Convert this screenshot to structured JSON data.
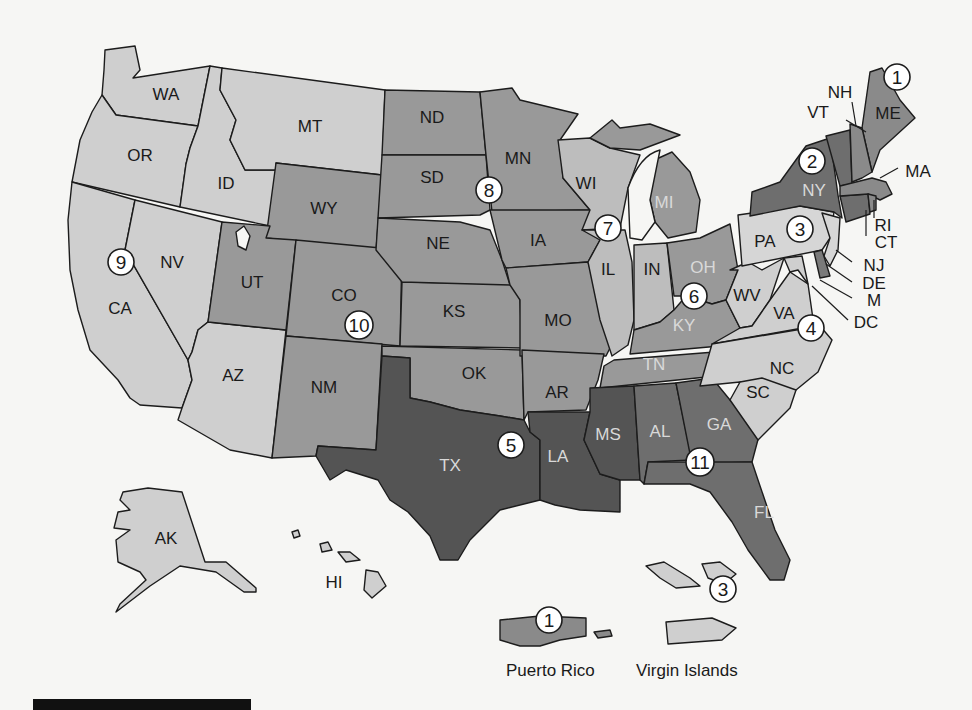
{
  "colors": {
    "background": "#f6f6f4",
    "shade_lightest": "#cfcfcf",
    "shade_light": "#bdbdbd",
    "shade_medium": "#9a9a9a",
    "shade_dark": "#7a7a7a",
    "shade_darkest": "#545454",
    "border": "#1c1c1c"
  },
  "states": {
    "WA": "WA",
    "OR": "OR",
    "CA": "CA",
    "NV": "NV",
    "ID": "ID",
    "MT": "MT",
    "AZ": "AZ",
    "AK": "AK",
    "HI": "HI",
    "WY": "WY",
    "UT": "UT",
    "CO": "CO",
    "NM": "NM",
    "KS": "KS",
    "OK": "OK",
    "ND": "ND",
    "SD": "SD",
    "NE": "NE",
    "MN": "MN",
    "IA": "IA",
    "MO": "MO",
    "AR": "AR",
    "WI": "WI",
    "IL": "IL",
    "IN": "IN",
    "MI": "MI",
    "OH": "OH",
    "KY": "KY",
    "TN": "TN",
    "TX": "TX",
    "LA": "LA",
    "MS": "MS",
    "AL": "AL",
    "GA": "GA",
    "FL": "FL",
    "WV": "WV",
    "VA": "VA",
    "NC": "NC",
    "SC": "SC",
    "MD": "M",
    "PA": "PA",
    "NJ": "NJ",
    "DE": "DE",
    "NY": "NY",
    "VT": "VT",
    "CT": "CT",
    "ME": "ME",
    "NH": "NH",
    "MA": "MA",
    "RI": "RI",
    "DC": "DC"
  },
  "circuits": [
    {
      "number": "1",
      "states": [
        "ME",
        "NH",
        "MA",
        "RI"
      ],
      "territories": [
        "Puerto Rico"
      ]
    },
    {
      "number": "2",
      "states": [
        "NY",
        "VT",
        "CT"
      ]
    },
    {
      "number": "3",
      "states": [
        "PA",
        "NJ",
        "DE"
      ],
      "territories": [
        "Virgin Islands"
      ]
    },
    {
      "number": "4",
      "states": [
        "MD",
        "VA",
        "WV",
        "NC",
        "SC"
      ]
    },
    {
      "number": "5",
      "states": [
        "TX",
        "LA",
        "MS"
      ]
    },
    {
      "number": "6",
      "states": [
        "MI",
        "OH",
        "KY",
        "TN"
      ]
    },
    {
      "number": "7",
      "states": [
        "WI",
        "IL",
        "IN"
      ]
    },
    {
      "number": "8",
      "states": [
        "ND",
        "SD",
        "NE",
        "MN",
        "IA",
        "MO",
        "AR"
      ]
    },
    {
      "number": "9",
      "states": [
        "WA",
        "OR",
        "CA",
        "NV",
        "ID",
        "MT",
        "AZ",
        "AK",
        "HI"
      ]
    },
    {
      "number": "10",
      "states": [
        "WY",
        "UT",
        "CO",
        "NM",
        "KS",
        "OK"
      ]
    },
    {
      "number": "11",
      "states": [
        "AL",
        "GA",
        "FL"
      ]
    }
  ],
  "territories": {
    "puerto_rico": "Puerto Rico",
    "virgin_islands": "Virgin Islands"
  }
}
